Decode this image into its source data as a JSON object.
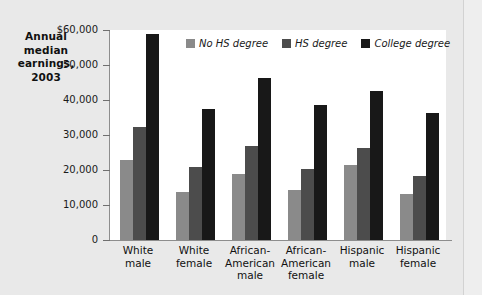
{
  "chart_data": {
    "type": "bar",
    "title": "",
    "ylabel": "Annual median earnings, 2003",
    "xlabel": "",
    "ylim": [
      0,
      60000
    ],
    "grid": false,
    "legend_position": "top-center",
    "ytick_labels": [
      "$60,000",
      "50,000",
      "40,000",
      "30,000",
      "20,000",
      "10,000",
      "0"
    ],
    "ytick_values": [
      60000,
      50000,
      40000,
      30000,
      20000,
      10000,
      0
    ],
    "categories": [
      "White male",
      "White female",
      "African-American male",
      "African-American female",
      "Hispanic male",
      "Hispanic female"
    ],
    "category_lines": [
      [
        "White",
        "male"
      ],
      [
        "White",
        "female"
      ],
      [
        "African-",
        "American",
        "male"
      ],
      [
        "African-",
        "American",
        "female"
      ],
      [
        "Hispanic",
        "male"
      ],
      [
        "Hispanic",
        "female"
      ]
    ],
    "series": [
      {
        "name": "No HS degree",
        "color": "#8a8a8a",
        "values": [
          23000,
          13600,
          19000,
          14300,
          21400,
          13100
        ]
      },
      {
        "name": "HS degree",
        "color": "#4c4c4c",
        "values": [
          32300,
          21000,
          26800,
          20200,
          26200,
          18200
        ]
      },
      {
        "name": "College degree",
        "color": "#181818",
        "values": [
          59000,
          37500,
          46300,
          38500,
          42600,
          36200
        ]
      }
    ]
  },
  "axis_title": {
    "lines": [
      "Annual",
      "median",
      "earnings,",
      "2003"
    ]
  },
  "colors": {
    "page_background": "#e9e9e9",
    "panel_background": "#ffffff",
    "axis": "#8d8d8d",
    "text": "#1a1a1a"
  }
}
